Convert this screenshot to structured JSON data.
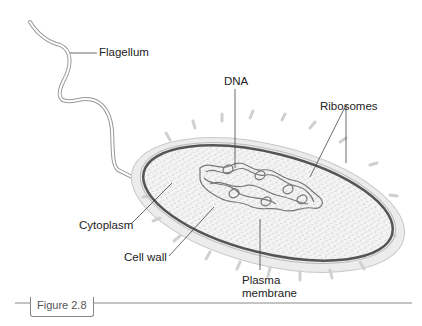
{
  "labels": {
    "flagellum": "Flagellum",
    "dna": "DNA",
    "ribosomes": "Ribosomes",
    "cytoplasm": "Cytoplasm",
    "cell_wall": "Cell wall",
    "plasma_membrane_line1": "Plasma",
    "plasma_membrane_line2": "membrane"
  },
  "caption": {
    "figure_label": "Figure 2.8"
  },
  "colors": {
    "membrane": "#555555",
    "cell_wall_fill": "#eeeeee",
    "cytoplasm_fill": "#f2f2f2",
    "dna": "#777777",
    "leader_line": "#444444"
  }
}
